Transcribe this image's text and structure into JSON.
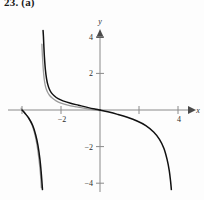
{
  "figure": {
    "exercise_label": "23. (a)",
    "background_color": "#fdfdfd",
    "x_axis_label": "x",
    "y_axis_label": "y"
  },
  "chart_data": {
    "type": "line",
    "title": "23. (a)",
    "xlabel": "x",
    "ylabel": "y",
    "grid": false,
    "legend": null,
    "xlim": [
      -4.5,
      5.0
    ],
    "ylim": [
      -4.6,
      4.6
    ],
    "x_ticks": [
      -4,
      -2,
      2,
      4
    ],
    "x_tick_labels": [
      "",
      "-2",
      "",
      "4"
    ],
    "y_ticks": [
      -4,
      -2,
      2,
      4
    ],
    "y_tick_labels": [
      "-4",
      "-2",
      "2",
      "4"
    ],
    "axis_arrows": [
      "x-positive",
      "y-positive"
    ],
    "vertical_asymptote": -2.9,
    "horizontal_asymptote": 0,
    "series": [
      {
        "name": "curve-dark",
        "color": "#111111",
        "branches": [
          {
            "name": "upper-left-branch",
            "x": [
              -2.92,
              -2.9,
              -2.88,
              -2.85,
              -2.8,
              -2.74,
              -2.68,
              -2.6,
              -2.5,
              -2.35,
              -2.15,
              -1.9,
              -1.55,
              -1.1,
              -0.6,
              -0.2,
              0.0
            ],
            "y": [
              4.35,
              4.0,
              3.5,
              2.9,
              2.2,
              1.7,
              1.4,
              1.15,
              0.95,
              0.78,
              0.62,
              0.5,
              0.38,
              0.26,
              0.13,
              0.04,
              0.0
            ]
          },
          {
            "name": "lower-left-branch",
            "x": [
              -4.0,
              -3.85,
              -3.65,
              -3.45,
              -3.3,
              -3.18,
              -3.08,
              -3.02,
              -2.98,
              -2.96,
              -2.95
            ],
            "y": [
              0.0,
              -0.18,
              -0.45,
              -0.85,
              -1.35,
              -1.95,
              -2.7,
              -3.35,
              -3.9,
              -4.2,
              -4.35
            ]
          },
          {
            "name": "right-branch",
            "x": [
              0.0,
              0.4,
              0.9,
              1.4,
              1.9,
              2.35,
              2.75,
              3.05,
              3.28,
              3.44,
              3.55,
              3.62,
              3.66
            ],
            "y": [
              0.0,
              -0.1,
              -0.24,
              -0.4,
              -0.6,
              -0.85,
              -1.2,
              -1.6,
              -2.1,
              -2.7,
              -3.3,
              -3.9,
              -4.35
            ]
          }
        ]
      },
      {
        "name": "curve-light",
        "color": "#9b9b9b",
        "branches": [
          {
            "name": "upper-left-branch-shadow",
            "x": [
              -2.98,
              -2.96,
              -2.93,
              -2.9,
              -2.85,
              -2.78,
              -2.7,
              -2.6,
              -2.45,
              -2.25,
              -2.0,
              -1.65,
              -1.2,
              -0.7,
              -0.25,
              0.0
            ],
            "y": [
              3.6,
              3.1,
              2.55,
              2.1,
              1.6,
              1.22,
              1.0,
              0.82,
              0.65,
              0.5,
              0.38,
              0.27,
              0.17,
              0.07,
              0.0,
              -0.04
            ]
          },
          {
            "name": "lower-left-branch-shadow",
            "x": [
              -4.05,
              -3.9,
              -3.7,
              -3.5,
              -3.36,
              -3.24,
              -3.14,
              -3.07,
              -3.03,
              -3.01
            ],
            "y": [
              0.1,
              -0.1,
              -0.38,
              -0.78,
              -1.25,
              -1.85,
              -2.6,
              -3.3,
              -3.85,
              -4.25
            ]
          }
        ]
      }
    ]
  }
}
